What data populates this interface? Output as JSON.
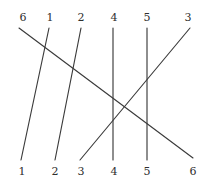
{
  "figure": {
    "type": "permutation-wiring-diagram",
    "width": 211,
    "height": 187,
    "background_color": "#ffffff",
    "line_color": "#3b3b3b",
    "label_color": "#2e2e2e"
  },
  "top_labels": [
    {
      "text": "6",
      "x": 16,
      "y": 12
    },
    {
      "text": "1",
      "x": 43,
      "y": 12
    },
    {
      "text": "2",
      "x": 74,
      "y": 12
    },
    {
      "text": "4",
      "x": 107,
      "y": 12
    },
    {
      "text": "5",
      "x": 140,
      "y": 12
    },
    {
      "text": "3",
      "x": 181,
      "y": 12
    }
  ],
  "bottom_labels": [
    {
      "text": "1",
      "x": 15,
      "y": 166
    },
    {
      "text": "2",
      "x": 48,
      "y": 166
    },
    {
      "text": "3",
      "x": 74,
      "y": 166
    },
    {
      "text": "4",
      "x": 107,
      "y": 166
    },
    {
      "text": "5",
      "x": 140,
      "y": 166
    },
    {
      "text": "6",
      "x": 186,
      "y": 166
    }
  ],
  "wires": [
    {
      "name": "wire-top6-to-bottom6",
      "x1": 19,
      "y1": 28,
      "x2": 193,
      "y2": 158
    },
    {
      "name": "wire-top1-to-bottom1",
      "x1": 49,
      "y1": 28,
      "x2": 21,
      "y2": 160
    },
    {
      "name": "wire-top2-to-bottom2",
      "x1": 81,
      "y1": 28,
      "x2": 55,
      "y2": 160
    },
    {
      "name": "wire-top4-to-bottom4",
      "x1": 113,
      "y1": 28,
      "x2": 113,
      "y2": 160
    },
    {
      "name": "wire-top5-to-bottom5",
      "x1": 147,
      "y1": 28,
      "x2": 147,
      "y2": 160
    },
    {
      "name": "wire-top3-to-bottom3",
      "x1": 190,
      "y1": 28,
      "x2": 80,
      "y2": 160
    }
  ]
}
